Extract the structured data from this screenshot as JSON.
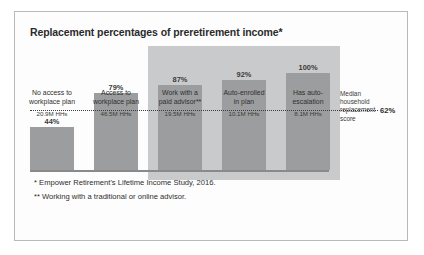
{
  "chart_data": {
    "type": "bar",
    "title": "Replacement percentages of preretirement income*",
    "xlabel": "",
    "ylabel": "",
    "ylim": [
      0,
      115
    ],
    "grid": false,
    "categories": [
      "No access to workplace plan",
      "Access to workplace plan",
      "Work with a paid advisor**",
      "Auto-enrolled in plan",
      "Has auto-escalation"
    ],
    "category_lines": [
      [
        "No access to",
        "workplace plan"
      ],
      [
        "Access to",
        "workplace plan"
      ],
      [
        "Work with a",
        "paid advisor**"
      ],
      [
        "Auto-enrolled",
        "in plan"
      ],
      [
        "Has auto-",
        "escalation"
      ]
    ],
    "values": [
      44,
      79,
      87,
      92,
      100
    ],
    "value_labels": [
      "44%",
      "79%",
      "87%",
      "92%",
      "100%"
    ],
    "sublabels": [
      "20.9M HHs",
      "46.5M HHs",
      "19.5M HHs",
      "10.1M HHs",
      "8.1M HHs"
    ],
    "reference_line": {
      "value": 62,
      "label_line1": "Median household",
      "label_line2": "replacement score",
      "value_label": "62%",
      "style": "dotted"
    },
    "highlighted_categories": [
      "Work with a paid advisor**",
      "Auto-enrolled in plan",
      "Has auto-escalation"
    ],
    "colors": {
      "bar": "#9c9d9e",
      "highlight_band": "#c9cacb",
      "reference_line": "#3c3c3c",
      "axis": "#8a8a8a",
      "frame": "#b9b9b9",
      "text": "#2b2b2b"
    }
  },
  "footnotes": {
    "one": "* Empower Retirement's Lifetime Income Study, 2016.",
    "two": "** Working with a traditional or online advisor."
  }
}
